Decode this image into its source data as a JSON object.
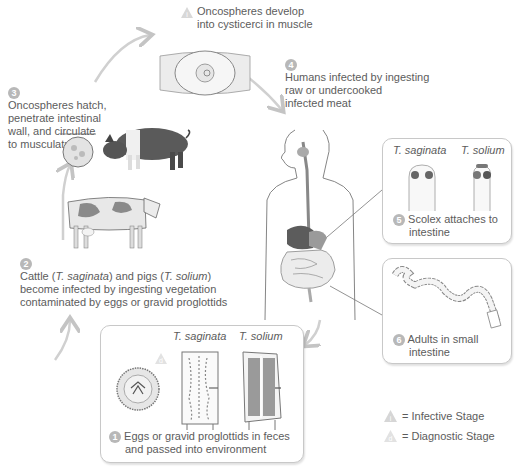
{
  "diagram": {
    "type": "life-cycle",
    "stages": [
      {
        "number": "1",
        "text_line1": "Eggs or gravid proglottids in feces",
        "text_line2": "and passed into environment",
        "species_labels": [
          "T. saginata",
          "T. solium"
        ]
      },
      {
        "number": "2",
        "text_prefix": "Cattle (",
        "species1": "T. saginata",
        "text_mid": ") and pigs (",
        "species2": "T. solium",
        "text_suffix": ")",
        "text_line2": "become infected by ingesting vegetation",
        "text_line3": "contaminated by eggs or gravid proglottids"
      },
      {
        "number": "3",
        "lines": [
          "Oncospheres hatch,",
          "penetrate intestinal",
          "wall, and circulate",
          "to musculature"
        ]
      },
      {
        "number": "",
        "lines": [
          "Oncospheres develop",
          "into cysticerci in muscle"
        ]
      },
      {
        "number": "4",
        "lines": [
          "Humans infected by ingesting",
          "raw or undercooked",
          "infected meat"
        ]
      },
      {
        "number": "5",
        "text_line1": "Scolex attaches to",
        "text_line2": "intestine",
        "species_labels": [
          "T. saginata",
          "T. solium"
        ]
      },
      {
        "number": "6",
        "text_line1": "Adults in small",
        "text_line2": "intestine"
      }
    ],
    "legend": [
      {
        "icon": "infective-stage-icon",
        "label": "= Infective Stage"
      },
      {
        "icon": "diagnostic-stage-icon",
        "label": "= Diagnostic Stage"
      }
    ],
    "colors": {
      "text": "#5c5c5c",
      "arrow": "#c4c4c4",
      "box_border": "#c8c8c8",
      "badge": "#b8b8b8"
    }
  }
}
